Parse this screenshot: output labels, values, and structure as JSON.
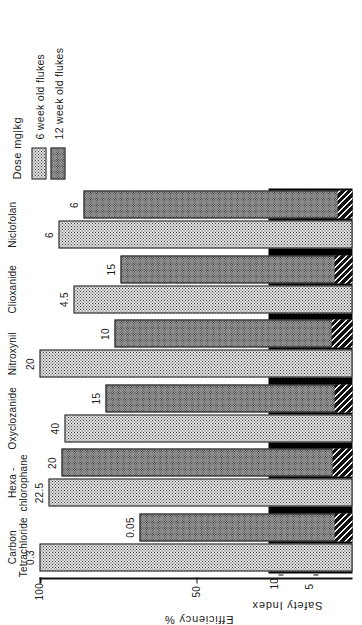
{
  "figure": {
    "legend_title": "Dose mg|kg",
    "legend": [
      {
        "label": "6 week old flukes",
        "pattern": "fine-dot",
        "color": "#e3e3e3"
      },
      {
        "label": "12 week old flukes",
        "pattern": "cross-hatch",
        "color": "#9a9a9a"
      }
    ],
    "safety_index_label": "Safety Index",
    "safety_index_ticks": [
      "10",
      "5"
    ],
    "efficiency_label": "Efficiency %",
    "efficiency_ticks": [
      "100",
      "50"
    ]
  },
  "chart_data": {
    "type": "bar",
    "title": "",
    "xlabel": "Efficiency %",
    "ylabel": "Dose mg|kg",
    "secondary_axis_label": "Safety Index",
    "orientation": "horizontal",
    "grid": false,
    "legend_position": "top-right",
    "xlim": [
      0,
      100
    ],
    "secondary_xlim": [
      0,
      12
    ],
    "categories": [
      "Carbon Tetrachloride",
      "Hexa-chlorophane",
      "Oxyclozanide",
      "Nitroxynil",
      "Clioxanide",
      "Niclofolan"
    ],
    "category_lines": [
      [
        "Carbon",
        "Tetrachloride"
      ],
      [
        "Hexa -",
        "chlorophane"
      ],
      [
        "Oxyclozanide"
      ],
      [
        "Nitroxynil"
      ],
      [
        "Clioxanide"
      ],
      [
        "Niclofolan"
      ]
    ],
    "series": [
      {
        "name": "6 week old flukes",
        "pattern": "fine-dot",
        "doses": [
          "0.3",
          "22.5",
          "40",
          "20",
          "4.5",
          "6"
        ],
        "values": [
          100,
          97,
          92,
          100,
          89,
          94
        ]
      },
      {
        "name": "12 week old flukes",
        "pattern": "cross-hatch",
        "doses": [
          "0.05",
          "20",
          "15",
          "10",
          "15",
          "6"
        ],
        "values": [
          68,
          93,
          79,
          76,
          74,
          86
        ]
      }
    ],
    "safety_index": {
      "name": "Safety Index",
      "pattern": "diagonal-hatch",
      "values": [
        2.6,
        2.8,
        2.6,
        3.0,
        2.6,
        2.1
      ],
      "ticks": [
        10,
        5
      ]
    },
    "efficiency_ticks": [
      100,
      50
    ]
  }
}
